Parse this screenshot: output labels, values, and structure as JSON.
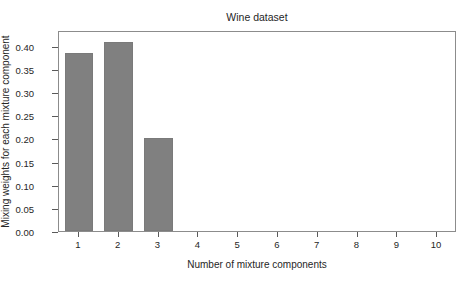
{
  "chart_data": {
    "type": "bar",
    "title": "Wine dataset",
    "xlabel": "Number of mixture components",
    "ylabel": "Mixing weights for each mixture component",
    "categories": [
      "1",
      "2",
      "3",
      "4",
      "5",
      "6",
      "7",
      "8",
      "9",
      "10"
    ],
    "values": [
      0.385,
      0.408,
      0.2,
      0.0,
      0.0,
      0.0,
      0.0,
      0.0,
      0.0,
      0.0
    ],
    "ylim": [
      0.0,
      0.4345
    ],
    "xlim": [
      0.5,
      10.5
    ],
    "yticks": [
      0.0,
      0.05,
      0.1,
      0.15,
      0.2,
      0.25,
      0.3,
      0.35,
      0.4
    ],
    "ytick_labels": [
      "0.00",
      "0.05",
      "0.10",
      "0.15",
      "0.20",
      "0.25",
      "0.30",
      "0.35",
      "0.40"
    ],
    "xtick_labels": [
      "1",
      "2",
      "3",
      "4",
      "5",
      "6",
      "7",
      "8",
      "9",
      "10"
    ],
    "grid": false,
    "legend": null,
    "bar_color": "#808080",
    "bar_edge_color": "#7a7a7a",
    "frame_color": "#8c8c8c",
    "text_color": "#262626",
    "background": "#ffffff",
    "bar_width_fraction": 0.72
  }
}
